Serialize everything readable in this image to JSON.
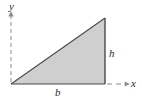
{
  "figure": {
    "background_color": "#ffffff",
    "shape": {
      "name": "right-triangle",
      "fill_color": "#cfcfcf",
      "stroke_color": "#4a4a4a",
      "vertices": [
        {
          "name": "bottom-left",
          "x": 11,
          "y": 84
        },
        {
          "name": "top-right",
          "x": 105,
          "y": 18
        },
        {
          "name": "bottom-right",
          "x": 105,
          "y": 84
        }
      ]
    },
    "axes": {
      "y_axis": {
        "label": "y",
        "style": "dashed",
        "color": "#8c8c8c",
        "x": 11,
        "y_start": 14,
        "y_end": 84,
        "arrow": "up"
      },
      "x_axis": {
        "label": "x",
        "style": "dashed",
        "color": "#8c8c8c",
        "y": 84,
        "x_start": 107,
        "x_end": 128,
        "arrow": "right"
      }
    },
    "labels": {
      "y": "y",
      "x": "x",
      "height": "h",
      "base": "b"
    }
  }
}
